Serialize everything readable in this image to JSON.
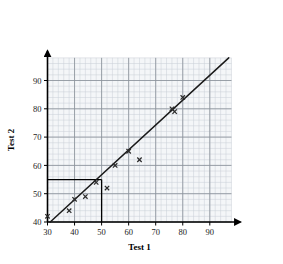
{
  "chart_data": {
    "type": "scatter",
    "title": "",
    "xlabel": "Test 1",
    "ylabel": "Test 2",
    "xlim": [
      30,
      98
    ],
    "ylim": [
      40,
      98
    ],
    "xticks": [
      30,
      40,
      50,
      60,
      70,
      80,
      90
    ],
    "yticks": [
      40,
      50,
      60,
      70,
      80,
      90
    ],
    "xtick_labels": [
      "30",
      "40",
      "50",
      "60",
      "70",
      "80",
      "90"
    ],
    "ytick_labels": [
      "40",
      "50",
      "60",
      "70",
      "80",
      "90"
    ],
    "grid": true,
    "grid_minor_step": 2,
    "grid_major_step": 10,
    "legend": "none",
    "marker": "x",
    "points": [
      {
        "x": 30,
        "y": 42
      },
      {
        "x": 38,
        "y": 44
      },
      {
        "x": 40,
        "y": 48
      },
      {
        "x": 44,
        "y": 49
      },
      {
        "x": 48,
        "y": 54
      },
      {
        "x": 52,
        "y": 52
      },
      {
        "x": 55,
        "y": 60
      },
      {
        "x": 60,
        "y": 65
      },
      {
        "x": 64,
        "y": 62
      },
      {
        "x": 76,
        "y": 80
      },
      {
        "x": 77,
        "y": 79
      },
      {
        "x": 80,
        "y": 84
      }
    ],
    "line_of_best_fit": {
      "x_start": 31,
      "y_start": 40,
      "x_end": 97,
      "y_end": 98
    },
    "construction_lines": {
      "y_value": 55,
      "x_value": 50,
      "horizontal_from_x": 30,
      "vertical_to_y": 40
    },
    "colors": {
      "grid_minor": "#c9cfd6",
      "grid_major": "#8d949c",
      "axis": "#000000",
      "data": "#2b2b2b",
      "fit_line": "#1a1a1a",
      "plot_background": "#f4f6f8"
    }
  },
  "axis_titles": {
    "x": "Test 1",
    "y": "Test 2"
  }
}
